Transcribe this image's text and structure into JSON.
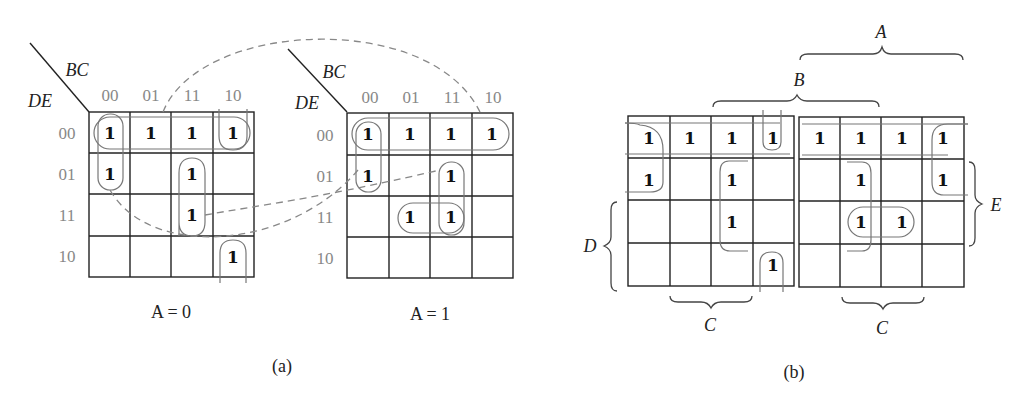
{
  "figure_a": {
    "caption": "(a)",
    "row_var": "DE",
    "col_var": "BC",
    "col_codes": [
      "00",
      "01",
      "11",
      "10"
    ],
    "row_codes": [
      "00",
      "01",
      "11",
      "10"
    ],
    "maps": [
      {
        "label": "A = 0",
        "cells": [
          [
            1,
            1,
            1,
            1
          ],
          [
            1,
            0,
            1,
            0
          ],
          [
            0,
            0,
            1,
            0
          ],
          [
            0,
            0,
            0,
            1
          ]
        ]
      },
      {
        "label": "A = 1",
        "cells": [
          [
            1,
            1,
            1,
            1
          ],
          [
            1,
            0,
            1,
            0
          ],
          [
            0,
            1,
            1,
            0
          ],
          [
            0,
            0,
            0,
            0
          ]
        ]
      }
    ]
  },
  "figure_b": {
    "caption": "(b)",
    "cells": [
      [
        1,
        1,
        1,
        1,
        1,
        1,
        1,
        1
      ],
      [
        1,
        0,
        1,
        0,
        0,
        1,
        0,
        1
      ],
      [
        0,
        0,
        1,
        0,
        0,
        1,
        1,
        0
      ],
      [
        0,
        0,
        0,
        1,
        0,
        0,
        0,
        0
      ]
    ],
    "brace_labels": {
      "A": "A",
      "B": "B",
      "C_left": "C",
      "C_right": "C",
      "D": "D",
      "E": "E"
    }
  },
  "one_symbol": "1"
}
